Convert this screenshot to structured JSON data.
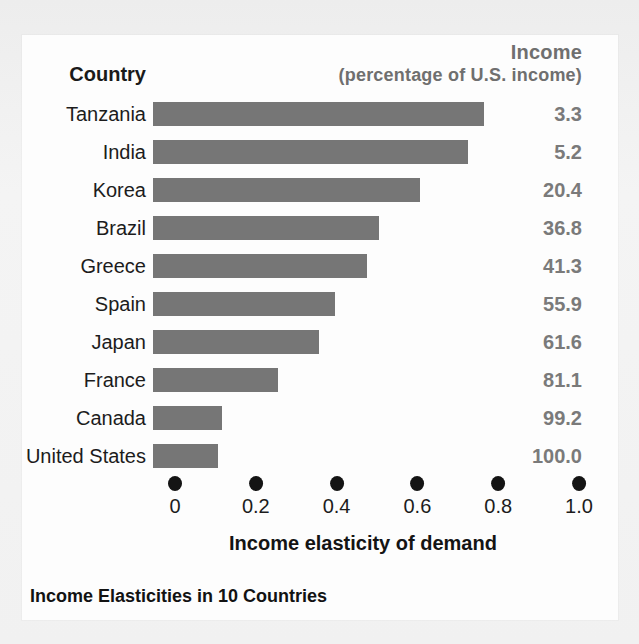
{
  "card": {
    "country_header": "Country",
    "income_header": "Income",
    "income_subheader": "(percentage of U.S. income)",
    "axis_title": "Income elasticity of demand",
    "figure_title": "Income Elasticities in 10 Countries"
  },
  "colors": {
    "bar": "#767676",
    "value_text": "#7a7a7a",
    "label_text": "#1c1c1c",
    "tick_dot": "#141414",
    "card_background": "#fdfdfd",
    "page_background": "#f1f1f1"
  },
  "chart_data": {
    "type": "bar",
    "orientation": "horizontal",
    "title": "Income Elasticities in 10 Countries",
    "xlabel": "Income elasticity of demand",
    "ylabel": "Country",
    "xlim": [
      0,
      1.0
    ],
    "xticks": [
      0,
      0.2,
      0.4,
      0.6,
      0.8,
      1.0
    ],
    "xtick_labels": [
      "0",
      "0.2",
      "0.4",
      "0.6",
      "0.8",
      "1.0"
    ],
    "grid": false,
    "legend": false,
    "categories": [
      "Tanzania",
      "India",
      "Korea",
      "Brazil",
      "Greece",
      "Spain",
      "Japan",
      "France",
      "Canada",
      "United States"
    ],
    "values": [
      0.82,
      0.78,
      0.66,
      0.56,
      0.53,
      0.45,
      0.41,
      0.31,
      0.17,
      0.16
    ],
    "series": [
      {
        "name": "Income elasticity of demand",
        "values": [
          0.82,
          0.78,
          0.66,
          0.56,
          0.53,
          0.45,
          0.41,
          0.31,
          0.17,
          0.16
        ]
      }
    ],
    "annotations": {
      "column_header": "Income (percentage of U.S. income)",
      "column_values": [
        "3.3",
        "5.2",
        "20.4",
        "36.8",
        "41.3",
        "55.9",
        "61.6",
        "81.1",
        "99.2",
        "100.0"
      ]
    },
    "rows": [
      {
        "country": "Tanzania",
        "elasticity": 0.82,
        "income_pct": "3.3"
      },
      {
        "country": "India",
        "elasticity": 0.78,
        "income_pct": "5.2"
      },
      {
        "country": "Korea",
        "elasticity": 0.66,
        "income_pct": "20.4"
      },
      {
        "country": "Brazil",
        "elasticity": 0.56,
        "income_pct": "36.8"
      },
      {
        "country": "Greece",
        "elasticity": 0.53,
        "income_pct": "41.3"
      },
      {
        "country": "Spain",
        "elasticity": 0.45,
        "income_pct": "55.9"
      },
      {
        "country": "Japan",
        "elasticity": 0.41,
        "income_pct": "61.6"
      },
      {
        "country": "France",
        "elasticity": 0.31,
        "income_pct": "81.1"
      },
      {
        "country": "Canada",
        "elasticity": 0.17,
        "income_pct": "99.2"
      },
      {
        "country": "United States",
        "elasticity": 0.16,
        "income_pct": "100.0"
      }
    ]
  }
}
